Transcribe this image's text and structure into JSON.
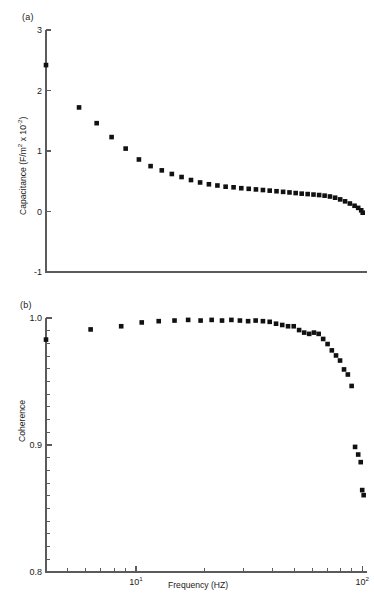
{
  "figure": {
    "panels": [
      {
        "tag": "(a)",
        "ylabel_main": "Capacitance (F/m",
        "ylabel_sup1": "2",
        "ylabel_mid": " x 10",
        "ylabel_sup2": "-2",
        "ylabel_end": ")"
      },
      {
        "tag": "(b)",
        "ylabel": "Coherence"
      }
    ],
    "xaxis": {
      "label": "Frequency (HZ)",
      "scale": "log",
      "tick_labels": [
        {
          "mantissa": "10",
          "exponent": "1",
          "value": 10
        },
        {
          "mantissa": "10",
          "exponent": "2",
          "value": 100
        }
      ],
      "range": [
        4.0,
        105.0
      ]
    }
  },
  "chart_data": [
    {
      "type": "scatter",
      "panel": "(a)",
      "title": "",
      "xlabel": "Frequency (HZ)",
      "ylabel": "Capacitance (F/m^2 x 10^-2)",
      "xscale": "log",
      "xlim": [
        4.0,
        105.0
      ],
      "ylim": [
        -1,
        3
      ],
      "yticks": [
        -1,
        0,
        1,
        2,
        3
      ],
      "xticks": [
        10,
        100
      ],
      "grid": false,
      "legend": "none",
      "marker": "filled-square",
      "color": "#111111",
      "x": [
        4.0,
        5.6,
        6.7,
        7.8,
        9.0,
        10.3,
        11.6,
        13.0,
        14.4,
        15.9,
        17.5,
        19.2,
        21.0,
        22.9,
        24.9,
        27.0,
        29.2,
        31.5,
        33.9,
        36.4,
        39.0,
        41.8,
        44.7,
        47.7,
        50.8,
        54.0,
        57.4,
        60.9,
        64.5,
        68.2,
        72.0,
        75.9,
        79.9,
        84.0,
        88.2,
        92.5,
        96.0,
        99.0,
        100.5
      ],
      "y": [
        2.42,
        1.72,
        1.46,
        1.23,
        1.04,
        0.86,
        0.75,
        0.68,
        0.62,
        0.57,
        0.52,
        0.48,
        0.45,
        0.43,
        0.41,
        0.4,
        0.385,
        0.375,
        0.365,
        0.355,
        0.345,
        0.335,
        0.325,
        0.315,
        0.305,
        0.295,
        0.288,
        0.28,
        0.272,
        0.262,
        0.248,
        0.228,
        0.2,
        0.168,
        0.132,
        0.095,
        0.06,
        0.02,
        -0.02
      ]
    },
    {
      "type": "scatter",
      "panel": "(b)",
      "title": "",
      "xlabel": "Frequency (HZ)",
      "ylabel": "Coherence",
      "xscale": "log",
      "xlim": [
        4.0,
        105.0
      ],
      "ylim": [
        0.8,
        1.0
      ],
      "yticks": [
        0.8,
        0.9,
        1.0
      ],
      "yticks_minor": [
        0.81,
        0.82,
        0.83,
        0.84,
        0.85,
        0.86,
        0.87,
        0.88,
        0.89,
        0.91,
        0.92,
        0.93,
        0.94,
        0.95,
        0.96,
        0.97,
        0.98,
        0.99
      ],
      "xticks": [
        10,
        100
      ],
      "grid": false,
      "legend": "none",
      "marker": "filled-square",
      "color": "#111111",
      "x": [
        4.0,
        6.3,
        8.6,
        10.6,
        12.6,
        14.8,
        17.0,
        19.3,
        21.6,
        24.0,
        26.4,
        28.8,
        31.3,
        33.8,
        36.4,
        39.0,
        41.6,
        44.3,
        47.0,
        49.8,
        52.6,
        55.4,
        58.3,
        61.2,
        64.2,
        67.2,
        70.3,
        73.4,
        76.6,
        79.8,
        83.1,
        86.4,
        89.8,
        93.0,
        96.0,
        98.5,
        100.0,
        101.5
      ],
      "y": [
        0.983,
        0.991,
        0.9935,
        0.9965,
        0.9975,
        0.998,
        0.9985,
        0.998,
        0.9985,
        0.998,
        0.9985,
        0.998,
        0.9975,
        0.998,
        0.9975,
        0.997,
        0.9955,
        0.9945,
        0.9935,
        0.9935,
        0.9905,
        0.9885,
        0.9875,
        0.9885,
        0.9875,
        0.9835,
        0.9795,
        0.9745,
        0.9705,
        0.9665,
        0.9595,
        0.9555,
        0.9465,
        0.8985,
        0.8925,
        0.8865,
        0.8645,
        0.8605
      ]
    }
  ]
}
